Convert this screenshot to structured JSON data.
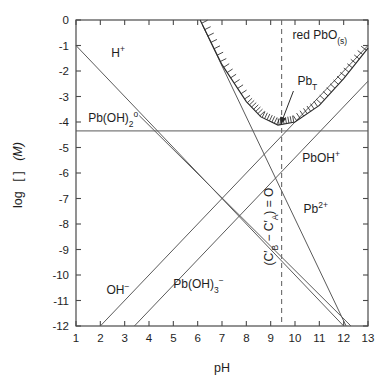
{
  "figure": {
    "name": "lead-hydroxide-log-concentration-diagram",
    "background_color": "#ffffff",
    "line_color": "#5a5a5a",
    "accent_color": "#2b2b2b"
  },
  "chart_data": {
    "type": "line",
    "title": "",
    "xlabel": "pH",
    "ylabel": "log [ ]  (M)",
    "ylabel_parts": {
      "log": "log",
      "brackets": "[ ]",
      "units": "(M)"
    },
    "xlim": [
      1,
      13
    ],
    "ylim": [
      -12,
      0
    ],
    "xticks": [
      1,
      2,
      3,
      4,
      5,
      6,
      7,
      8,
      9,
      10,
      11,
      12,
      13
    ],
    "xticklabels": [
      "1",
      "2",
      "3",
      "4",
      "5",
      "6",
      "7",
      "8",
      "9",
      "10",
      "11",
      "12",
      "13"
    ],
    "yticks": [
      0,
      -1,
      -2,
      -3,
      -4,
      -5,
      -6,
      -7,
      -8,
      -9,
      -10,
      -11,
      -12
    ],
    "yticklabels": [
      "0",
      "-1",
      "-2",
      "-3",
      "-4",
      "-5",
      "-6",
      "-7",
      "-8",
      "-9",
      "-10",
      "-11",
      "-12"
    ],
    "grid": false,
    "legend": "none",
    "series": [
      {
        "name": "H+",
        "label": "H⁺",
        "label_html": "H<sup>+</sup>",
        "label_x": 2.45,
        "label_y": -1.45,
        "slope": -1,
        "points": [
          [
            1,
            -1
          ],
          [
            12,
            -12
          ]
        ]
      },
      {
        "name": "OH-",
        "label": "OH⁻",
        "label_html": "OH<sup>&minus;</sup>",
        "label_x": 2.25,
        "label_y": -10.75,
        "slope": 1,
        "points": [
          [
            2,
            -12
          ],
          [
            13,
            -1
          ]
        ]
      },
      {
        "name": "Pb(OH)2 aqueous",
        "label": "Pb(OH)2°",
        "label_html": "Pb(OH)<sub>2</sub><sup>o</sup>",
        "label_x": 1.5,
        "label_y": -4.0,
        "slope": 0,
        "points": [
          [
            1,
            -4.35
          ],
          [
            13,
            -4.35
          ]
        ]
      },
      {
        "name": "Pb(OH)3-",
        "label": "Pb(OH)3⁻",
        "label_html": "Pb(OH)<sub>3</sub><sup>&minus;</sup>",
        "label_x": 5.0,
        "label_y": -10.5,
        "slope": 1,
        "points": [
          [
            3.4,
            -12
          ],
          [
            13,
            -2.4
          ]
        ]
      },
      {
        "name": "Pb2+",
        "label": "Pb2+",
        "label_html": "Pb<sup>2+</sup>",
        "label_x": 10.35,
        "label_y": -7.55,
        "slope": -2,
        "points": [
          [
            6.2,
            -0.2
          ],
          [
            12.1,
            -12
          ]
        ]
      },
      {
        "name": "PbOH+",
        "label": "PbOH+",
        "label_html": "PbOH<sup>+</sup>",
        "label_x": 10.3,
        "label_y": -5.55,
        "slope": -1,
        "points": [
          [
            3.6,
            -3.75
          ],
          [
            12.3,
            -12
          ]
        ]
      },
      {
        "name": "PbT total lead solubility",
        "label": "PbT",
        "label_html": "Pb<sub>T</sub>",
        "label_x": 10.1,
        "label_y": -2.55,
        "minimum_ph": 9.3,
        "minimum_value": -4.1,
        "points": [
          [
            6.1,
            0.0
          ],
          [
            7.0,
            -1.75
          ],
          [
            8.0,
            -3.2
          ],
          [
            8.6,
            -3.8
          ],
          [
            9.3,
            -4.12
          ],
          [
            10.0,
            -4.0
          ],
          [
            11.0,
            -3.35
          ],
          [
            12.0,
            -2.3
          ],
          [
            13.0,
            -1.1
          ]
        ]
      }
    ],
    "annotations": [
      {
        "name": "red-pbo-solid",
        "text": "red PbO(s)",
        "text_html": "red PbO<sub>(s)</sub>",
        "x": 9.9,
        "y": -0.75
      },
      {
        "name": "charge-balance-dashed-line",
        "text": "(C'B - C'A) = 0",
        "text_html": "(C&prime;<sub>B</sub> &minus; C&prime;<sub>A</sub>) = O",
        "x": 9.45,
        "y": -8.1,
        "orientation": "vertical",
        "line_x": 9.45,
        "line_y_range": [
          -12,
          0
        ],
        "style": "dashed"
      }
    ]
  }
}
